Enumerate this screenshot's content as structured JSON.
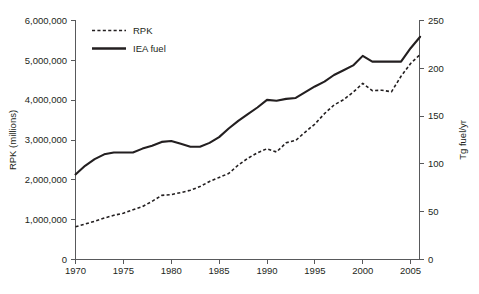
{
  "chart_data": {
    "type": "line",
    "title": "",
    "subtitle": "",
    "xlabel": "",
    "ylabel": "RPK (millions)",
    "y2label": "Tg fuel/yr",
    "grid": false,
    "legend_position": "top-left-inside",
    "xlim": [
      1970,
      2006
    ],
    "ylim": [
      0,
      6000000
    ],
    "y2lim": [
      0,
      250
    ],
    "xticks": [
      1970,
      1975,
      1980,
      1985,
      1990,
      1995,
      2000,
      2005
    ],
    "xtick_labels": [
      "1970",
      "1975",
      "1980",
      "1985",
      "1990",
      "1995",
      "2000",
      "2005"
    ],
    "yticks": [
      0,
      1000000,
      2000000,
      3000000,
      4000000,
      5000000,
      6000000
    ],
    "ytick_labels": [
      "0",
      "1,000,000",
      "2,000,000",
      "3,000,000",
      "4,000,000",
      "5,000,000",
      "6,000,000"
    ],
    "y2ticks": [
      0,
      50,
      100,
      150,
      200,
      250
    ],
    "y2tick_labels": [
      "0",
      "50",
      "100",
      "150",
      "200",
      "250"
    ],
    "x": [
      1970,
      1971,
      1972,
      1973,
      1974,
      1975,
      1976,
      1977,
      1978,
      1979,
      1980,
      1981,
      1982,
      1983,
      1984,
      1985,
      1986,
      1987,
      1988,
      1989,
      1990,
      1991,
      1992,
      1993,
      1994,
      1995,
      1996,
      1997,
      1998,
      1999,
      2000,
      2001,
      2002,
      2003,
      2004,
      2005,
      2006
    ],
    "series": [
      {
        "name": "RPK",
        "axis": "left",
        "style": "dashed",
        "color": "#231f20",
        "units": "millions",
        "values": [
          820000,
          890000,
          960000,
          1040000,
          1110000,
          1160000,
          1250000,
          1330000,
          1460000,
          1610000,
          1630000,
          1680000,
          1740000,
          1830000,
          1960000,
          2060000,
          2160000,
          2370000,
          2540000,
          2680000,
          2780000,
          2700000,
          2930000,
          2990000,
          3200000,
          3400000,
          3660000,
          3880000,
          4010000,
          4200000,
          4420000,
          4240000,
          4250000,
          4210000,
          4600000,
          4920000,
          5150000
        ]
      },
      {
        "name": "IEA fuel",
        "axis": "right",
        "style": "solid",
        "color": "#231f20",
        "units": "Tg fuel/yr",
        "values_tg": [
          89.0,
          98.0,
          105.0,
          110.0,
          112.0,
          112.0,
          112.0,
          116.0,
          119.0,
          123.0,
          124.0,
          121.0,
          118.0,
          118.0,
          122.0,
          128.0,
          137.0,
          145.0,
          152.0,
          159.0,
          167.0,
          166.0,
          168.0,
          169.0,
          175.0,
          181.0,
          186.0,
          193.0,
          198.0,
          203.0,
          213.0,
          207.0,
          207.0,
          207.0,
          207.0,
          221.0,
          233.0
        ]
      }
    ]
  },
  "legend": {
    "entries": [
      {
        "label": "RPK",
        "style": "dashed"
      },
      {
        "label": "IEA fuel",
        "style": "solid"
      }
    ]
  },
  "axes": {
    "left_title": "RPK (millions)",
    "right_title": "Tg fuel/yr"
  }
}
